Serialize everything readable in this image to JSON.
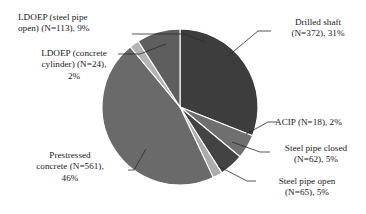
{
  "chart_data": {
    "type": "pie",
    "title": "",
    "subtitle": "",
    "xlabel": "",
    "ylabel": "",
    "legend_position": "none",
    "grid": false,
    "label_format": "{name} (N={count}), {percent}%",
    "total_count": 1191,
    "start_angle_deg": 0,
    "direction": "clockwise",
    "center": {
      "x": 180,
      "y": 107
    },
    "radius": 78,
    "slice_border_color": "#ffffff",
    "categories": [
      "Drilled shaft",
      "Steel pipe open",
      "Steel pipe closed",
      "ACIP",
      "Prestressed concrete",
      "LDOEP (concrete cylinder)",
      "LDOEP (steel pipe open)"
    ],
    "values": [
      31,
      5,
      5,
      2,
      46,
      2,
      9
    ],
    "counts": [
      372,
      65,
      62,
      18,
      561,
      24,
      113
    ],
    "slices": [
      {
        "name": "Drilled shaft",
        "count": 372,
        "percent": 31,
        "color": "#3d3d3d",
        "label": "Drilled shaft\n(N=372), 31%"
      },
      {
        "name": "Steel pipe open",
        "count": 65,
        "percent": 5,
        "color": "#6f6f6f",
        "label": "Steel pipe open\n(N=65), 5%"
      },
      {
        "name": "Steel pipe closed",
        "count": 62,
        "percent": 5,
        "color": "#434343",
        "label": "Steel pipe closed\n(N=62), 5%"
      },
      {
        "name": "ACIP",
        "count": 18,
        "percent": 2,
        "color": "#acacac",
        "label": "ACIP (N=18), 2%"
      },
      {
        "name": "Prestressed concrete",
        "count": 561,
        "percent": 46,
        "color": "#6a6a6a",
        "label": "Prestressed\nconcrete (N=561),\n46%"
      },
      {
        "name": "LDOEP (concrete cylinder)",
        "count": 24,
        "percent": 2,
        "color": "#b4b4b4",
        "label": "LDOEP (concrete\ncylinder) (N=24),\n2%"
      },
      {
        "name": "LDOEP (steel pipe open)",
        "count": 113,
        "percent": 9,
        "color": "#5e5e5e",
        "label": "LDOEP (steel pipe\nopen) (N=113), 9%"
      }
    ]
  },
  "labels": {
    "ldoep_steel_pipe_open": "LDOEP (steel pipe\nopen) (N=113), 9%",
    "ldoep_concrete_cylinder": "LDOEP (concrete\ncylinder) (N=24),\n2%",
    "prestressed_concrete": "Prestressed\nconcrete (N=561),\n46%",
    "drilled_shaft": "Drilled shaft\n(N=372), 31%",
    "acip": "ACIP (N=18), 2%",
    "steel_pipe_closed": "Steel pipe closed\n(N=62), 5%",
    "steel_pipe_open": "Steel pipe open\n(N=65), 5%"
  }
}
